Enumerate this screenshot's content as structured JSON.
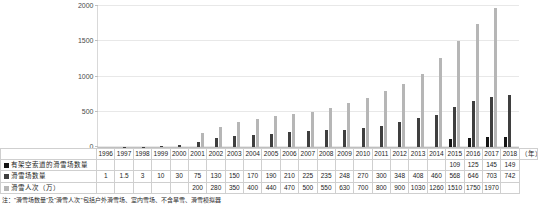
{
  "chart_data": {
    "type": "bar",
    "title": "",
    "xlabel": "(年)",
    "ylabel": "",
    "ylim": [
      0,
      2000
    ],
    "yticks": [
      0,
      500,
      1000,
      1500,
      2000
    ],
    "grid": true,
    "legend_position": "table-row-labels",
    "categories": [
      "1996",
      "1997",
      "1998",
      "1999",
      "2000",
      "2001",
      "2002",
      "2003",
      "2004",
      "2005",
      "2006",
      "2007",
      "2008",
      "2009",
      "2010",
      "2011",
      "2012",
      "2013",
      "2014",
      "2015",
      "2016",
      "2017",
      "2018"
    ],
    "series": [
      {
        "name": "有架空索道的滑雪场数量",
        "color": "#151515",
        "values": [
          null,
          null,
          null,
          null,
          null,
          null,
          null,
          null,
          null,
          null,
          null,
          null,
          null,
          null,
          null,
          null,
          null,
          null,
          null,
          109,
          125,
          145,
          149
        ]
      },
      {
        "name": "滑雪场数量",
        "color": "#3f3f3f",
        "values": [
          1,
          1.5,
          3,
          10,
          30,
          75,
          130,
          150,
          170,
          190,
          210,
          225,
          235,
          248,
          270,
          300,
          348,
          408,
          460,
          568,
          646,
          703,
          742
        ]
      },
      {
        "name": "滑雪人次（万）",
        "color": "#b6b6b6",
        "values": [
          null,
          null,
          null,
          null,
          null,
          200,
          280,
          350,
          400,
          440,
          470,
          500,
          550,
          630,
          700,
          800,
          900,
          1030,
          1260,
          1510,
          1750,
          1970,
          null
        ]
      }
    ]
  },
  "table": {
    "year_header_cells": [
      "1996",
      "1997",
      "1998",
      "1999",
      "2000",
      "2001",
      "2002",
      "2003",
      "2004",
      "2005",
      "2006",
      "2007",
      "2008",
      "2009",
      "2010",
      "2011",
      "2012",
      "2013",
      "2014",
      "2015",
      "2016",
      "2017",
      "2018"
    ],
    "year_unit": "（年）",
    "rows": [
      {
        "label": "有架空索道的滑雪场数量",
        "swatch_class": "sw0",
        "values": [
          "",
          "",
          "",
          "",
          "",
          "",
          "",
          "",
          "",
          "",
          "",
          "",
          "",
          "",
          "",
          "",
          "",
          "",
          "",
          "109",
          "125",
          "145",
          "149"
        ]
      },
      {
        "label": "滑雪场数量",
        "swatch_class": "sw1",
        "values": [
          "1",
          "1.5",
          "3",
          "10",
          "30",
          "75",
          "130",
          "150",
          "170",
          "190",
          "210",
          "225",
          "235",
          "248",
          "270",
          "300",
          "348",
          "408",
          "460",
          "568",
          "646",
          "703",
          "742"
        ]
      },
      {
        "label": "滑雪人次（万）",
        "swatch_class": "sw2",
        "values": [
          "",
          "",
          "",
          "",
          "",
          "200",
          "280",
          "350",
          "400",
          "440",
          "470",
          "500",
          "550",
          "630",
          "700",
          "800",
          "900",
          "1030",
          "1260",
          "1510",
          "1750",
          "1970",
          ""
        ]
      }
    ]
  },
  "footnote": {
    "text": "注：\"滑雪场数量\"及\"滑雪人次\"包括户外滑雪场、室内雪场、不含旱雪、滑雪模拟器"
  },
  "axis": {
    "y_tick_labels": [
      "0",
      "500",
      "1000",
      "1500",
      "2000"
    ]
  }
}
